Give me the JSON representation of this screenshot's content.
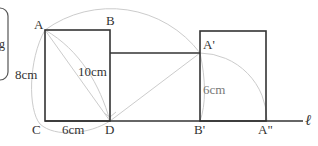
{
  "figure": {
    "type": "geometry-rotation-diagram",
    "points": {
      "A": {
        "label": "A",
        "x": 45,
        "y": 30
      },
      "B": {
        "label": "B",
        "x": 110,
        "y": 30
      },
      "C": {
        "label": "C",
        "x": 45,
        "y": 121
      },
      "D": {
        "label": "D",
        "x": 110,
        "y": 121
      },
      "A_prime": {
        "label": "A'",
        "x": 200,
        "y": 53
      },
      "B_prime": {
        "label": "B'",
        "x": 200,
        "y": 121
      },
      "A_double_prime": {
        "label": "A\"",
        "x": 266,
        "y": 121
      }
    },
    "measurements": {
      "AC": "8cm",
      "CD": "6cm",
      "AD": "10cm",
      "A_prime_B_prime": "6cm"
    },
    "line_label": "ℓ",
    "colors": {
      "stroke": "#333333",
      "construction": "#cccccc",
      "box_border": "#555555"
    }
  }
}
